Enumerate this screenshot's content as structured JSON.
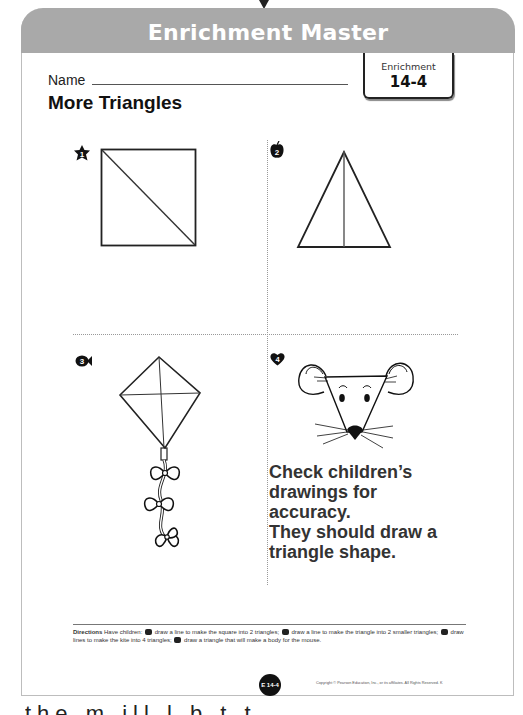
{
  "header": {
    "title": "Enrichment Master"
  },
  "name_field": {
    "label": "Name",
    "value": ""
  },
  "lesson": {
    "title": "More Triangles"
  },
  "badge": {
    "label": "Enrichment",
    "number": "14-4"
  },
  "problems": [
    {
      "number": "1",
      "icon": "star-number-icon",
      "figure": "square-with-diagonal"
    },
    {
      "number": "2",
      "icon": "apple-number-icon",
      "figure": "triangle-with-median"
    },
    {
      "number": "3",
      "icon": "fish-number-icon",
      "figure": "kite-with-crossed-lines-and-bows"
    },
    {
      "number": "4",
      "icon": "heart-number-icon",
      "figure": "mouse-head"
    }
  ],
  "answer": {
    "line1": "Check children’s",
    "line2": "drawings for",
    "line3": "accuracy.",
    "line4": "They should draw a",
    "line5": "triangle shape."
  },
  "directions": {
    "label": "Directions",
    "part1": "Have children:",
    "part2": "draw a line to make the square into 2 triangles;",
    "part3": "draw a line to make the triangle into 2 smaller triangles;",
    "part4": "draw lines to make the kite into 4 triangles;",
    "part5": "draw a triangle that will make a body for the mouse."
  },
  "footer": {
    "page_label": "E 14-4",
    "copyright": "Copyright © Pearson Education, Inc., or its affiliates. All Rights Reserved. K"
  },
  "cutoff_text": "the   m   ill   l   b   t   t"
}
